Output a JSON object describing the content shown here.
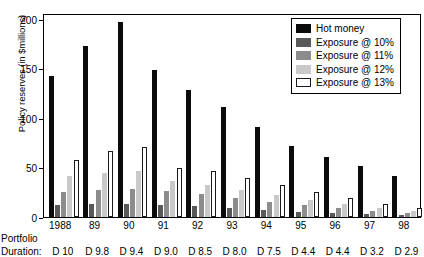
{
  "axes": {
    "ylabel": "Policy reserves (in $millions)",
    "yticks": [
      0,
      50,
      100,
      150,
      200
    ],
    "ylim": [
      0,
      206
    ]
  },
  "legend": {
    "items": [
      {
        "label": "Hot money",
        "color": "#0b0b0b"
      },
      {
        "label": "Exposure @ 10%",
        "color": "#595959"
      },
      {
        "label": "Exposure @ 11%",
        "color": "#8c8c8c"
      },
      {
        "label": "Exposure @ 12%",
        "color": "#c9c9c9"
      },
      {
        "label": "Exposure @ 13%",
        "color": "#ffffff"
      }
    ]
  },
  "footer": {
    "portfolio_label": "Portfolio",
    "duration_label": "Duration:",
    "durations": [
      "D  10",
      "D  9.8",
      "D  9.4",
      "D  9.0",
      "D  8.5",
      "D  8.0",
      "D  7.5",
      "D  4.4",
      "D  4.4",
      "D  3.2",
      "D  2.9"
    ]
  },
  "chart_data": {
    "type": "bar",
    "title": "",
    "xlabel": "",
    "ylabel": "Policy reserves (in $millions)",
    "ylim": [
      0,
      206
    ],
    "yticks": [
      0,
      50,
      100,
      150,
      200
    ],
    "grid": false,
    "legend_position": "top-right",
    "categories": [
      "1988",
      "89",
      "90",
      "91",
      "92",
      "93",
      "94",
      "95",
      "96",
      "97",
      "98"
    ],
    "series": [
      {
        "name": "Hot money",
        "values": [
          142,
          173,
          197,
          148,
          128,
          111,
          91,
          72,
          61,
          52,
          41
        ]
      },
      {
        "name": "Exposure @ 10%",
        "values": [
          12,
          13,
          13,
          12,
          11,
          9,
          7,
          5,
          4,
          3,
          2
        ]
      },
      {
        "name": "Exposure @ 11%",
        "values": [
          25,
          27,
          28,
          26,
          23,
          19,
          15,
          12,
          9,
          6,
          4
        ]
      },
      {
        "name": "Exposure @ 12%",
        "values": [
          41,
          44,
          46,
          36,
          32,
          27,
          22,
          17,
          13,
          9,
          6
        ]
      },
      {
        "name": "Exposure @ 13%",
        "values": [
          58,
          67,
          71,
          50,
          46,
          39,
          32,
          25,
          19,
          13,
          9
        ]
      }
    ]
  }
}
